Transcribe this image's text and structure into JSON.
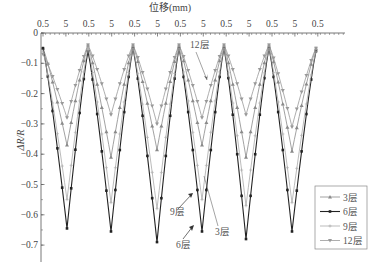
{
  "chart_data": {
    "type": "line",
    "title": "",
    "xlabel": "位移(mm)",
    "ylabel": "ΔR/R",
    "ylim": [
      -0.75,
      0
    ],
    "yticks": [
      0,
      -0.1,
      -0.2,
      -0.3,
      -0.4,
      -0.5,
      -0.6,
      -0.7
    ],
    "ytick_labels": [
      "0",
      "−0.1",
      "−0.2",
      "−0.3",
      "−0.4",
      "−0.5",
      "−0.6",
      "−0.7"
    ],
    "xtick_labels": [
      "0.5",
      "5",
      "0.5",
      "5",
      "0.5",
      "5",
      "0.5",
      "5",
      "0.5",
      "5",
      "0.5",
      "5",
      "0.5"
    ],
    "x_axis_position": "top",
    "grid": false,
    "legend_position": "lower right",
    "cycles": 6,
    "x": [
      "0.5",
      "5",
      "0.5",
      "5",
      "0.5",
      "5",
      "0.5",
      "5",
      "0.5",
      "5",
      "0.5",
      "5",
      "0.5"
    ],
    "series": [
      {
        "name": "3层",
        "color": "#8a8a8a",
        "marker": "triangle",
        "values": [
          -0.05,
          -0.37,
          -0.04,
          -0.41,
          -0.04,
          -0.385,
          -0.04,
          -0.37,
          -0.04,
          -0.41,
          -0.04,
          -0.39,
          -0.05
        ]
      },
      {
        "name": "6层",
        "color": "#222222",
        "marker": "square",
        "values": [
          -0.05,
          -0.645,
          -0.06,
          -0.655,
          -0.05,
          -0.69,
          -0.05,
          -0.655,
          -0.05,
          -0.68,
          -0.05,
          -0.655,
          -0.06
        ]
      },
      {
        "name": "9层",
        "color": "#aaaaaa",
        "marker": "plus",
        "values": [
          -0.06,
          -0.55,
          -0.05,
          -0.56,
          -0.05,
          -0.58,
          -0.05,
          -0.55,
          -0.05,
          -0.57,
          -0.05,
          -0.56,
          -0.06
        ]
      },
      {
        "name": "12层",
        "color": "#999999",
        "marker": "down-triangle",
        "values": [
          -0.07,
          -0.28,
          -0.04,
          -0.27,
          -0.04,
          -0.3,
          -0.04,
          -0.28,
          -0.04,
          -0.27,
          -0.04,
          -0.31,
          -0.05
        ]
      }
    ],
    "annotations": [
      {
        "text": "12层",
        "target_series": "12层"
      },
      {
        "text": "9层",
        "target_series": "9层"
      },
      {
        "text": "6层",
        "target_series": "6层"
      },
      {
        "text": "3层",
        "target_series": "3层"
      }
    ]
  },
  "figure": {
    "xlabel": "位移(mm)",
    "ylabel": "ΔR/R",
    "legend": [
      "3层",
      "6层",
      "9层",
      "12层"
    ],
    "annotation_labels": {
      "l12": "12层",
      "l9": "9层",
      "l6": "6层",
      "l3": "3层"
    }
  }
}
